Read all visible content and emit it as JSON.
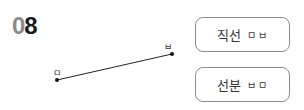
{
  "problem": {
    "number_first_digit": "0",
    "number_second_digit": "8"
  },
  "figure": {
    "point_left_label": "ㅁ",
    "point_right_label": "ㅂ",
    "segment": {
      "x1": 57,
      "y1": 80,
      "x2": 172,
      "y2": 54
    },
    "line_color": "#222222"
  },
  "choices": [
    {
      "term": "직선",
      "points": "ㅁㅂ"
    },
    {
      "term": "선분",
      "points": "ㅂㅁ"
    }
  ]
}
